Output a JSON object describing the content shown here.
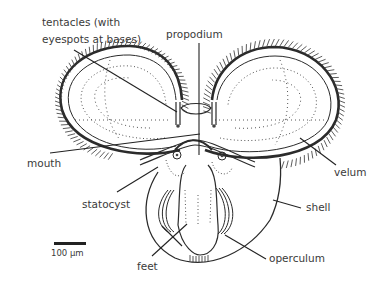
{
  "diagram": {
    "labels": {
      "tentacles": "tentacles (with",
      "tentacles_line2": "eyespots at bases)",
      "propodium": "propodium",
      "mouth": "mouth",
      "velum": "velum",
      "statocyst": "statocyst",
      "shell": "shell",
      "feet": "feet",
      "operculum": "operculum"
    },
    "scale_bar": {
      "label": "100 μm"
    },
    "colors": {
      "ink": "#2b2b2b",
      "text": "#3a3a3a",
      "background": "#ffffff"
    }
  }
}
